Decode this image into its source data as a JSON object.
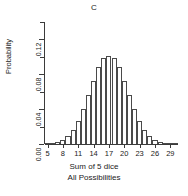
{
  "chart_data": {
    "type": "bar",
    "title": "C",
    "subtitle": "",
    "xlabel": "Sum of 5 dice",
    "xlabel2": "All Possibilities",
    "ylabel": "Probability",
    "categories": [
      5,
      6,
      7,
      8,
      9,
      10,
      11,
      12,
      13,
      14,
      15,
      16,
      17,
      18,
      19,
      20,
      21,
      22,
      23,
      24,
      25,
      26,
      27,
      28,
      29,
      30
    ],
    "values": [
      0.0001,
      0.0006,
      0.0019,
      0.0051,
      0.0116,
      0.0231,
      0.0409,
      0.0656,
      0.0961,
      0.1286,
      0.1573,
      0.1752,
      0.1752,
      0.1573,
      0.1286,
      0.0961,
      0.0656,
      0.0409,
      0.0231,
      0.0116,
      0.0051,
      0.0019,
      0.0006,
      0.0001,
      0.0,
      0.0
    ],
    "probabilities": [
      0.00013,
      0.00064,
      0.00193,
      0.0045,
      0.009,
      0.0162,
      0.02649,
      0.03986,
      0.05568,
      0.07279,
      0.08822,
      0.09838,
      0.10082,
      0.09838,
      0.08822,
      0.07279,
      0.05568,
      0.03986,
      0.02649,
      0.0162,
      0.009,
      0.0045,
      0.00193,
      0.00064,
      0.00013,
      0.00013
    ],
    "xticks": [
      5,
      8,
      11,
      14,
      17,
      20,
      23,
      26,
      29
    ],
    "xtick_labels": [
      "5",
      "8",
      "11",
      "14",
      "17",
      "20",
      "23",
      "26",
      "29"
    ],
    "yticks": [
      0.0,
      0.02,
      0.04,
      0.06,
      0.08,
      0.1,
      0.12,
      0.14
    ],
    "ytick_labels_major": [
      "0.00",
      "0.04",
      "0.08",
      "0.12"
    ],
    "ylim": [
      0,
      0.14
    ],
    "xlim": [
      4.5,
      30.5
    ],
    "grid": false,
    "legend": false,
    "bar_fill": "#ffffff",
    "bar_stroke": "#4a4a4a",
    "axis_color": "#3b3b3b"
  }
}
